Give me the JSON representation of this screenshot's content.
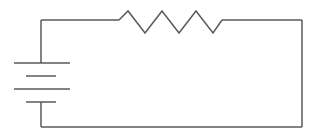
{
  "diagram": {
    "type": "electrical-schematic",
    "canvas": {
      "width": 319,
      "height": 137,
      "background_color": "#ffffff"
    },
    "style": {
      "line_color": "#5a5a5a",
      "line_width": 1.5,
      "plate_color": "#5a5a5a"
    },
    "loop": {
      "label": "circuit-loop",
      "left_x": 41,
      "right_x": 302,
      "top_y": 20,
      "bottom_y": 127
    },
    "components": [
      {
        "id": "battery",
        "label": "Battery",
        "symbol": "multi-cell-battery",
        "orientation": "vertical",
        "center_x": 41,
        "cells": 2,
        "plates": [
          {
            "kind": "long",
            "y": 63,
            "x1": 14,
            "x2": 70,
            "thickness": 1.5
          },
          {
            "kind": "short",
            "y": 76,
            "x1": 26,
            "x2": 56,
            "thickness": 1.5
          },
          {
            "kind": "long",
            "y": 89,
            "x1": 14,
            "x2": 70,
            "thickness": 1.5
          },
          {
            "kind": "short",
            "y": 102,
            "x1": 26,
            "x2": 56,
            "thickness": 1.5
          }
        ],
        "lead_top": {
          "x": 41,
          "y1": 20,
          "y2": 63
        },
        "lead_bottom": {
          "x": 41,
          "y1": 102,
          "y2": 127
        }
      },
      {
        "id": "resistor",
        "label": "Resistor",
        "symbol": "zigzag-resistor",
        "orientation": "horizontal",
        "baseline_y": 20,
        "start_x": 119,
        "end_x": 222,
        "peak_y": 11,
        "valley_y": 33,
        "zigzag_points": "119,20 128,11 145,33 162,11 179,33 196,11 213,33 222,20"
      }
    ],
    "wires": [
      {
        "id": "wire-top-left",
        "points": "41,20 119,20"
      },
      {
        "id": "wire-top-right",
        "points": "222,20 302,20"
      },
      {
        "id": "wire-right",
        "points": "302,20 302,127"
      },
      {
        "id": "wire-bottom",
        "points": "302,127 41,127"
      },
      {
        "id": "wire-left-upper",
        "points": "41,20 41,63"
      },
      {
        "id": "wire-left-lower",
        "points": "41,102 41,127"
      }
    ]
  }
}
